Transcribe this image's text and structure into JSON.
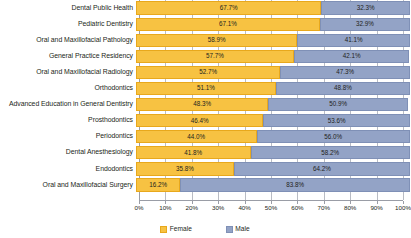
{
  "chart_data": {
    "type": "bar",
    "orientation": "horizontal",
    "stacked": true,
    "normalized_percent": true,
    "title": "",
    "subtitle": "",
    "xlabel": "",
    "ylabel": "",
    "xlim": [
      0,
      100
    ],
    "xtick_labels": [
      "0%",
      "10%",
      "20%",
      "30%",
      "40%",
      "50%",
      "60%",
      "70%",
      "80%",
      "90%",
      "100%"
    ],
    "xtick_values": [
      0,
      10,
      20,
      30,
      40,
      50,
      60,
      70,
      80,
      90,
      100
    ],
    "grid": true,
    "grid_axis": "x",
    "legend_position": "bottom",
    "categories": [
      "Dental Public Health",
      "Pediatric Dentistry",
      "Oral and Maxillofacial Pathology",
      "General Practice Residency",
      "Oral and Maxillofacial Radiology",
      "Orthodontics",
      "Advanced Education in General Dentistry",
      "Prosthodontics",
      "Periodontics",
      "Dental Anesthesiology",
      "Endodontics",
      "Oral and Maxillofacial Surgery"
    ],
    "series": [
      {
        "name": "Female",
        "color": "#f7c242",
        "values": [
          67.7,
          67.1,
          58.9,
          57.7,
          52.7,
          51.1,
          48.3,
          46.4,
          44.0,
          41.8,
          35.8,
          16.2
        ],
        "labels": [
          "67.7%",
          "67.1%",
          "58.9%",
          "57.7%",
          "52.7%",
          "51.1%",
          "48.3%",
          "46.4%",
          "44.0%",
          "41.8%",
          "35.8%",
          "16.2%"
        ]
      },
      {
        "name": "Male",
        "color": "#93a3c6",
        "values": [
          32.3,
          32.9,
          41.1,
          42.1,
          47.3,
          48.8,
          50.9,
          53.6,
          56.0,
          58.2,
          64.2,
          83.8
        ],
        "labels": [
          "32.3%",
          "32.9%",
          "41.1%",
          "42.1%",
          "47.3%",
          "48.8%",
          "50.9%",
          "53.6%",
          "56.0%",
          "58.2%",
          "64.2%",
          "83.8%"
        ]
      }
    ]
  },
  "legend": {
    "items": [
      {
        "label": "Female",
        "swatch": "female-swatch-icon"
      },
      {
        "label": "Male",
        "swatch": "male-swatch-icon"
      }
    ]
  }
}
